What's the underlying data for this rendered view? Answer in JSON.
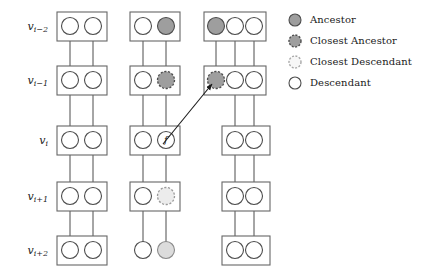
{
  "figure": {
    "node_label_f": "f",
    "colors": {
      "box_stroke": "#666666",
      "node_stroke": "#4d4d4d",
      "edge": "#4d4d4d",
      "arrow": "#1a1a1a",
      "ancestor_fill": "#9e9e9e",
      "closest_ancestor_fill": "#9e9e9e",
      "closest_descendant_fill": "#e0e0e0",
      "descendant_fill": "#ffffff",
      "light_gray_fill": "#dcdcdc",
      "text": "#1a1a1a"
    },
    "row_labels": [
      {
        "base": "v",
        "sub": "i−2"
      },
      {
        "base": "v",
        "sub": "i−1"
      },
      {
        "base": "v",
        "sub": "i"
      },
      {
        "base": "v",
        "sub": "i+1"
      },
      {
        "base": "v",
        "sub": "i+2"
      }
    ],
    "legend": {
      "items": [
        {
          "icon": "filled-gray-circle-icon",
          "label": "Ancestor",
          "style": "solid",
          "fill": "#9e9e9e"
        },
        {
          "icon": "dashed-gray-circle-icon",
          "label": "Closest Ancestor",
          "style": "dashed",
          "fill": "#9e9e9e"
        },
        {
          "icon": "dashed-light-circle-icon",
          "label": "Closest Descendant",
          "style": "dashed",
          "fill": "#f2f2f2"
        },
        {
          "icon": "open-circle-icon",
          "label": "Descendant",
          "style": "solid",
          "fill": "#ffffff"
        }
      ]
    },
    "columns": [
      {
        "name": "column-left",
        "rows": [
          {
            "row": "v_i-2",
            "boxed": true,
            "nodes": [
              "descendant",
              "descendant"
            ]
          },
          {
            "row": "v_i-1",
            "boxed": true,
            "nodes": [
              "descendant",
              "descendant"
            ]
          },
          {
            "row": "v_i",
            "boxed": true,
            "nodes": [
              "descendant",
              "descendant"
            ]
          },
          {
            "row": "v_i+1",
            "boxed": true,
            "nodes": [
              "descendant",
              "descendant"
            ]
          },
          {
            "row": "v_i+2",
            "boxed": true,
            "nodes": [
              "descendant",
              "descendant"
            ]
          }
        ]
      },
      {
        "name": "column-middle",
        "rows": [
          {
            "row": "v_i-2",
            "boxed": true,
            "nodes": [
              "descendant",
              "ancestor"
            ]
          },
          {
            "row": "v_i-1",
            "boxed": true,
            "nodes": [
              "descendant",
              "closest-ancestor"
            ]
          },
          {
            "row": "v_i",
            "boxed": true,
            "nodes": [
              "descendant",
              "labeled-f"
            ]
          },
          {
            "row": "v_i+1",
            "boxed": true,
            "nodes": [
              "descendant",
              "closest-descendant"
            ]
          },
          {
            "row": "v_i+2",
            "boxed": false,
            "nodes": [
              "descendant",
              "light-gray"
            ]
          }
        ]
      },
      {
        "name": "column-right",
        "rows": [
          {
            "row": "v_i-2",
            "boxed": true,
            "nodes": [
              "ancestor",
              "descendant",
              "descendant"
            ]
          },
          {
            "row": "v_i-1",
            "boxed": true,
            "nodes": [
              "closest-ancestor",
              "descendant",
              "descendant"
            ]
          },
          {
            "row": "v_i",
            "boxed": true,
            "nodes": [
              "descendant",
              "descendant"
            ]
          },
          {
            "row": "v_i+1",
            "boxed": true,
            "nodes": [
              "descendant",
              "descendant"
            ]
          },
          {
            "row": "v_i+2",
            "boxed": true,
            "nodes": [
              "descendant",
              "descendant"
            ]
          }
        ]
      }
    ],
    "arrow": {
      "name": "pointer-arrow",
      "from": {
        "x": 176,
        "y": 140
      },
      "to": {
        "x": 216,
        "y": 88
      }
    }
  }
}
